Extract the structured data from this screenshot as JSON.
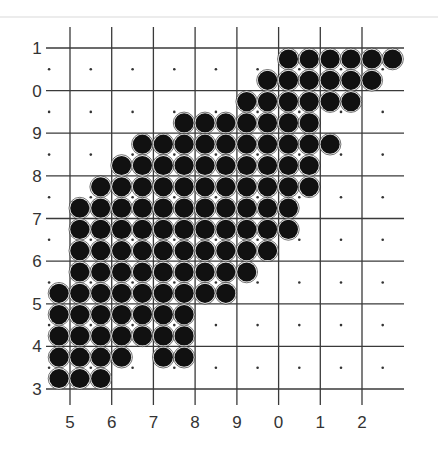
{
  "figure": {
    "top_separator_color": "#e6e6e6",
    "grid_color": "#3a3a3a",
    "circle_color": "#111111",
    "dot_color": "#333333",
    "label_color": "#333333"
  },
  "axes": {
    "x_labels": [
      "5",
      "6",
      "7",
      "8",
      "9",
      "0",
      "1",
      "2"
    ],
    "y_labels": [
      "1",
      "0",
      "9",
      "8",
      "7",
      "6",
      "5",
      "4",
      "3"
    ]
  },
  "grid": {
    "x_lines": [
      70,
      111.7,
      153.4,
      195.1,
      236.9,
      278.6,
      320.3,
      362
    ],
    "y_lines": [
      48,
      90.6,
      133.2,
      175.9,
      218.5,
      261.1,
      303.8,
      346.4,
      389
    ],
    "x_start": 46,
    "x_end": 404,
    "y_top": 27,
    "y_bottom": 405
  },
  "lattice": {
    "x0": 59,
    "dx": 20.85,
    "y0": 59,
    "dy": 21.3,
    "radius": 9.6
  },
  "filled_rows": [
    {
      "row": 0,
      "cols": [
        11,
        16
      ]
    },
    {
      "row": 1,
      "cols": [
        10,
        15
      ]
    },
    {
      "row": 2,
      "cols": [
        9,
        14
      ]
    },
    {
      "row": 3,
      "cols": [
        6,
        12
      ]
    },
    {
      "row": 4,
      "cols": [
        4,
        13
      ]
    },
    {
      "row": 5,
      "cols": [
        3,
        12
      ]
    },
    {
      "row": 6,
      "cols": [
        2,
        12
      ]
    },
    {
      "row": 7,
      "cols": [
        1,
        11
      ]
    },
    {
      "row": 8,
      "cols": [
        1,
        11
      ]
    },
    {
      "row": 9,
      "cols": [
        1,
        10
      ]
    },
    {
      "row": 10,
      "cols": [
        1,
        9
      ]
    },
    {
      "row": 11,
      "cols": [
        0,
        8
      ]
    },
    {
      "row": 12,
      "cols": [
        0,
        6
      ]
    },
    {
      "row": 13,
      "cols": [
        0,
        6
      ]
    },
    {
      "row": 14,
      "cols": [
        0,
        3
      ],
      "extra": [
        5,
        6
      ]
    },
    {
      "row": 15,
      "cols": [
        0,
        2
      ]
    }
  ]
}
